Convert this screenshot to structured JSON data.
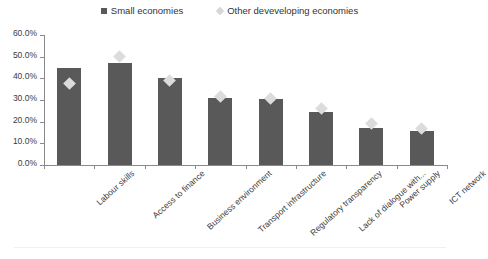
{
  "legend": {
    "position": "top-center",
    "entries": [
      {
        "label": "Small economies",
        "marker": "square-icon",
        "color": "#595959"
      },
      {
        "label": "Other deveveloping economies",
        "marker": "diamond-icon",
        "color": "#dcdcdc"
      }
    ]
  },
  "chart_data": {
    "type": "bar",
    "title": "",
    "subtitle": "",
    "xlabel": "",
    "ylabel": "",
    "ylim": [
      0,
      60
    ],
    "ytick_labels": [
      "60.0%",
      "50.0%",
      "40.0%",
      "30.0%",
      "20.0%",
      "10.0%",
      "0.0%"
    ],
    "ytick_values": [
      60,
      50,
      40,
      30,
      20,
      10,
      0
    ],
    "grid": false,
    "categories": [
      "Labour skills",
      "Access to finance",
      "Business environment",
      "Transport infrastructure",
      "Regulatory transparency",
      "Lack of dialogue with...",
      "Power supply",
      "ICT network"
    ],
    "series": [
      {
        "name": "Small economies",
        "type": "bar",
        "color": "#595959",
        "values": [
          45.0,
          47.0,
          40.0,
          31.0,
          30.5,
          24.5,
          17.0,
          15.5
        ]
      },
      {
        "name": "Other deveveloping economies",
        "type": "marker",
        "color": "#dcdcdc",
        "values": [
          37.5,
          50.0,
          39.0,
          31.5,
          30.5,
          26.0,
          19.0,
          17.0
        ]
      }
    ]
  }
}
